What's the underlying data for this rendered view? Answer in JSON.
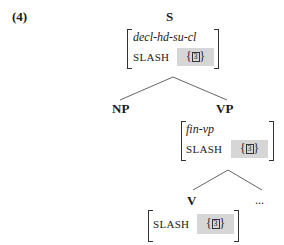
{
  "example_number": "(4)",
  "tree": {
    "root": {
      "label": "S",
      "avm": {
        "type": "decl-hd-su-cl",
        "feature": "SLASH",
        "value_open": "{",
        "tag": "3",
        "value_close": "}"
      }
    },
    "children": [
      {
        "label": "NP"
      },
      {
        "label": "VP",
        "avm": {
          "type": "fin-vp",
          "feature": "SLASH",
          "value_open": "{",
          "tag": "3",
          "value_close": "}"
        },
        "children": [
          {
            "label": "V",
            "avm": {
              "feature": "SLASH",
              "value_open": "{",
              "tag": "3",
              "value_close": "}"
            }
          },
          {
            "label": "..."
          }
        ]
      }
    ]
  },
  "colors": {
    "highlight": "#d6d6d6",
    "line": "#555555"
  }
}
